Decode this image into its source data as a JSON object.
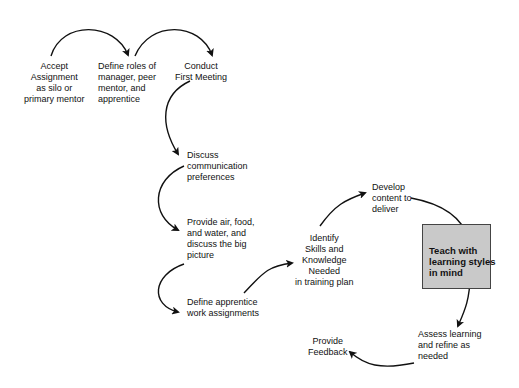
{
  "diagram": {
    "type": "process-flow",
    "nodes": [
      {
        "id": "accept",
        "label": "Accept\nAssignment\nas silo or\nprimary mentor"
      },
      {
        "id": "define_roles",
        "label": "Define roles of\nmanager, peer\nmentor, and\napprentice"
      },
      {
        "id": "first_meeting",
        "label": "Conduct\nFirst Meeting"
      },
      {
        "id": "discuss_comm",
        "label": "Discuss\ncommunication\npreferences"
      },
      {
        "id": "provide_air",
        "label": "Provide air, food,\nand water, and\ndiscuss the big\npicture"
      },
      {
        "id": "define_work",
        "label": "Define apprentice\nwork assignments"
      },
      {
        "id": "identify_skills",
        "label": "Identify\nSkills and\nKnowledge\nNeeded\nin training plan"
      },
      {
        "id": "develop_content",
        "label": "Develop\ncontent to\ndeliver"
      },
      {
        "id": "teach",
        "label": "Teach with\nlearning styles\nin mind",
        "highlight": true,
        "fill": "#c9c9c9"
      },
      {
        "id": "assess",
        "label": "Assess learning\nand refine as\nneeded"
      },
      {
        "id": "feedback",
        "label": "Provide\nFeedback"
      }
    ],
    "edges": [
      [
        "accept",
        "define_roles"
      ],
      [
        "define_roles",
        "first_meeting"
      ],
      [
        "first_meeting",
        "discuss_comm"
      ],
      [
        "discuss_comm",
        "provide_air"
      ],
      [
        "provide_air",
        "define_work"
      ],
      [
        "define_work",
        "identify_skills"
      ],
      [
        "identify_skills",
        "develop_content"
      ],
      [
        "develop_content",
        "teach"
      ],
      [
        "teach",
        "assess"
      ],
      [
        "assess",
        "feedback"
      ]
    ]
  }
}
